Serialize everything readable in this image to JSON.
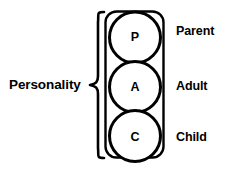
{
  "diagram": {
    "group_label": "Personality",
    "stroke_color": "#000000",
    "fill_color": "#ffffff",
    "background_color": "#ffffff",
    "brace": {
      "icon": "curly-brace-left-icon",
      "orientation": "points-left"
    },
    "bracket": {
      "icon": "rounded-rectangle-bracket-icon",
      "encloses": "three ego-state circles"
    },
    "ego_states": [
      {
        "initial": "P",
        "label": "Parent",
        "circle_name": "parent-circle"
      },
      {
        "initial": "A",
        "label": "Adult",
        "circle_name": "adult-circle"
      },
      {
        "initial": "C",
        "label": "Child",
        "circle_name": "child-circle"
      }
    ]
  }
}
